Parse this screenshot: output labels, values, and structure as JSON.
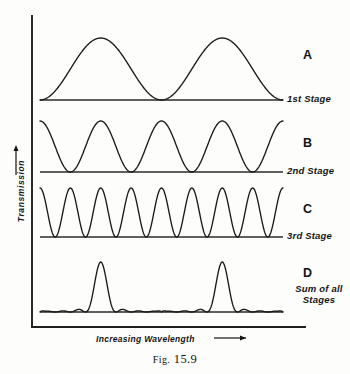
{
  "figure": {
    "caption_prefix": "Fig.",
    "caption_number": "15.9",
    "caption_full": "FIG. 15.9",
    "x_axis_label": "Increasing  Wavelength",
    "x_axis_arrow": "⟶",
    "y_axis_label": "Transmission",
    "y_axis_arrow": "↑"
  },
  "stages": [
    {
      "letter": "A",
      "caption": "1st Stage",
      "caption_lines": [
        "1st Stage"
      ]
    },
    {
      "letter": "B",
      "caption": "2nd Stage",
      "caption_lines": [
        "2nd Stage"
      ]
    },
    {
      "letter": "C",
      "caption": "3rd Stage",
      "caption_lines": [
        "3rd Stage"
      ]
    },
    {
      "letter": "D",
      "caption": "Sum of all Stages",
      "caption_lines": [
        "Sum of all",
        "Stages"
      ]
    }
  ],
  "colors": {
    "ink": "#141414",
    "curve": "#1a1a1a",
    "baseline": "#2a2a2a",
    "background": "#fdfdfb"
  },
  "chart_data": {
    "type": "line",
    "title": "FIG. 15.9",
    "xlabel": "Increasing Wavelength",
    "ylabel": "Transmission",
    "grid": false,
    "legend": "right",
    "axis_origin_px": {
      "x": 32,
      "y": 327
    },
    "plot_x_range_px": [
      40,
      283
    ],
    "xlim": [
      0,
      2
    ],
    "ylim": [
      0,
      1
    ],
    "note": "Lyot birefringent filter stages: transmission = cos^2 of increasing retardance; D is the product of A, B and C.",
    "series": [
      {
        "name": "A",
        "label": "1st Stage",
        "function": "cos^2(pi*x)",
        "periods": 2,
        "baseline_y_px": 100,
        "peak_y_px": 38,
        "amplitude_px": 62,
        "peaks_x_px": [
          102,
          224
        ],
        "minima_x_px": [
          41,
          163,
          284
        ],
        "phase": "starts at minimum"
      },
      {
        "name": "B",
        "label": "2nd Stage",
        "function": "cos^2(2*pi*x)",
        "periods": 4,
        "baseline_y_px": 172,
        "peak_y_px": 121,
        "amplitude_px": 51,
        "peaks_x_px": [
          41,
          102,
          163,
          224,
          284
        ],
        "minima_x_px": [
          71,
          132,
          193,
          253
        ],
        "phase": "starts at maximum"
      },
      {
        "name": "C",
        "label": "3rd Stage",
        "function": "cos^2(4*pi*x)",
        "periods": 8,
        "baseline_y_px": 237,
        "peak_y_px": 188,
        "amplitude_px": 49,
        "peaks_x_px": [
          41,
          71,
          102,
          132,
          163,
          193,
          224,
          253,
          284
        ],
        "minima_x_px": [
          56,
          86,
          117,
          147,
          178,
          208,
          238,
          269
        ],
        "phase": "starts at maximum"
      },
      {
        "name": "D",
        "label": "Sum of all Stages",
        "function": "cos^2(pi*x)*cos^2(2*pi*x)*cos^2(4*pi*x)",
        "baseline_y_px": 312,
        "peak_y_px": 262,
        "amplitude_px": 50,
        "main_peaks_x_px": [
          102,
          224
        ],
        "sidelobe_peaks_x_px": [
          56,
          71,
          86,
          117,
          132,
          147,
          178,
          193,
          208,
          238,
          253,
          269
        ],
        "sidelobe_height_px": 5,
        "phase": "narrow transmission peaks with small side lobes"
      }
    ]
  }
}
